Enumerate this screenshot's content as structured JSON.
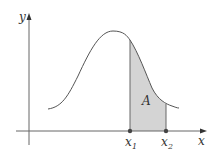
{
  "diagram": {
    "type": "bell-curve-area",
    "axes": {
      "x_label": "x",
      "y_label": "y"
    },
    "points": {
      "x1_label": "x",
      "x1_sub": "1",
      "x2_label": "x",
      "x2_sub": "2"
    },
    "region_label": "A",
    "colors": {
      "curve": "#555555",
      "axis": "#555555",
      "fill": "#d4d4d4",
      "point": "#444444"
    }
  }
}
